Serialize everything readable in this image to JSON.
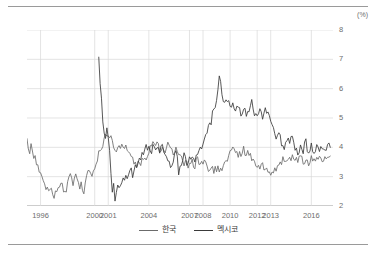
{
  "unit_label": "(%)",
  "legend": {
    "items": [
      {
        "label": "한국",
        "color": "#6b6b6b",
        "icon": "line-swatch-icon"
      },
      {
        "label": "멕시코",
        "color": "#3a3a3a",
        "icon": "line-swatch-icon"
      }
    ]
  },
  "chart_data": {
    "type": "line",
    "title": "",
    "subtitle": "",
    "xlabel": "",
    "ylabel": "(%)",
    "ylim": [
      2,
      8
    ],
    "xlim": [
      1995.0,
      2017.6
    ],
    "yticks": [
      2,
      3,
      4,
      5,
      6,
      7,
      8
    ],
    "ytick_labels": [
      "2",
      "3",
      "4",
      "5",
      "6",
      "7",
      "8"
    ],
    "xticks": [
      1996,
      2000,
      2001,
      2004,
      2007,
      2008,
      2010,
      2012,
      2013,
      2016
    ],
    "xtick_labels": [
      "1996",
      "2000",
      "2001",
      "2004",
      "2007",
      "2008",
      "2010",
      "2012",
      "2013",
      "2016"
    ],
    "grid": true,
    "grid_color": "#d8d8d8",
    "legend_position": "bottom",
    "series": [
      {
        "name": "한국",
        "color": "#6b6b6b",
        "x": [
          1995.0,
          1995.1,
          1995.2,
          1995.3,
          1995.4,
          1995.5,
          1995.6,
          1995.7,
          1995.8,
          1995.9,
          1996.0,
          1996.1,
          1996.2,
          1996.3,
          1996.4,
          1996.5,
          1996.6,
          1996.7,
          1996.8,
          1996.9,
          1997.0,
          1997.1,
          1997.2,
          1997.3,
          1997.4,
          1997.5,
          1997.6,
          1997.7,
          1997.8,
          1997.9,
          1998.0,
          1998.1,
          1998.2,
          1998.3,
          1998.4,
          1998.5,
          1998.6,
          1998.7,
          1998.8,
          1998.9,
          1999.0,
          1999.1,
          1999.2,
          1999.3,
          1999.4,
          1999.5,
          1999.6,
          1999.7,
          1999.8,
          1999.9,
          2000.0,
          2000.2,
          2000.4,
          2000.6,
          2000.8,
          2001.0,
          2001.2,
          2001.4,
          2001.6,
          2001.8,
          2002.0,
          2002.2,
          2002.4,
          2002.6,
          2002.8,
          2003.0,
          2003.2,
          2003.4,
          2003.6,
          2003.8,
          2004.0,
          2004.2,
          2004.4,
          2004.6,
          2004.8,
          2005.0,
          2005.2,
          2005.4,
          2005.6,
          2005.8,
          2006.0,
          2006.2,
          2006.4,
          2006.6,
          2006.8,
          2007.0,
          2007.2,
          2007.4,
          2007.6,
          2007.8,
          2008.0,
          2008.2,
          2008.4,
          2008.6,
          2008.8,
          2009.0,
          2009.2,
          2009.4,
          2009.6,
          2009.8,
          2010.0,
          2010.2,
          2010.4,
          2010.6,
          2010.8,
          2011.0,
          2011.2,
          2011.4,
          2011.6,
          2011.8,
          2012.0,
          2012.2,
          2012.4,
          2012.6,
          2012.8,
          2013.0,
          2013.2,
          2013.4,
          2013.6,
          2013.8,
          2014.0,
          2014.2,
          2014.4,
          2014.6,
          2014.8,
          2015.0,
          2015.2,
          2015.4,
          2015.6,
          2015.8,
          2016.0,
          2016.2,
          2016.4,
          2016.6,
          2016.8,
          2017.0,
          2017.2,
          2017.4
        ],
        "y": [
          4.2,
          4.0,
          3.9,
          4.0,
          3.8,
          3.7,
          3.6,
          3.5,
          3.4,
          3.3,
          3.2,
          3.0,
          2.9,
          2.8,
          2.7,
          2.6,
          2.6,
          2.7,
          2.6,
          2.5,
          2.4,
          2.5,
          2.6,
          2.7,
          2.6,
          2.9,
          2.8,
          2.6,
          2.5,
          2.6,
          2.7,
          2.9,
          3.1,
          3.0,
          2.8,
          2.9,
          3.1,
          2.9,
          2.7,
          2.6,
          2.8,
          2.6,
          2.5,
          2.7,
          2.9,
          3.1,
          3.3,
          3.2,
          3.0,
          3.2,
          3.4,
          3.6,
          3.9,
          4.1,
          4.3,
          4.5,
          4.3,
          4.1,
          3.9,
          4.0,
          4.2,
          4.1,
          3.9,
          3.7,
          3.6,
          3.5,
          3.4,
          3.5,
          3.6,
          3.7,
          3.9,
          4.1,
          4.0,
          4.1,
          3.9,
          4.0,
          3.9,
          4.1,
          4.0,
          3.8,
          3.9,
          3.7,
          3.6,
          3.5,
          3.4,
          3.3,
          3.5,
          3.4,
          3.6,
          3.5,
          3.4,
          3.5,
          3.3,
          3.4,
          3.2,
          3.3,
          3.2,
          3.3,
          3.5,
          3.6,
          3.8,
          3.9,
          3.8,
          3.7,
          3.8,
          3.9,
          3.8,
          3.7,
          3.6,
          3.5,
          3.4,
          3.3,
          3.4,
          3.3,
          3.2,
          3.1,
          3.2,
          3.3,
          3.4,
          3.5,
          3.6,
          3.5,
          3.6,
          3.7,
          3.6,
          3.5,
          3.6,
          3.5,
          3.6,
          3.5,
          3.6,
          3.5,
          3.6,
          3.7,
          3.6,
          3.7,
          3.8,
          3.7
        ]
      },
      {
        "name": "멕시코",
        "color": "#3a3a3a",
        "x": [
          2000.3,
          2000.4,
          2000.5,
          2000.6,
          2000.7,
          2000.8,
          2000.9,
          2001.0,
          2001.1,
          2001.2,
          2001.3,
          2001.4,
          2001.5,
          2001.6,
          2001.7,
          2001.8,
          2001.9,
          2002.0,
          2002.2,
          2002.4,
          2002.6,
          2002.8,
          2003.0,
          2003.2,
          2003.4,
          2003.6,
          2003.8,
          2004.0,
          2004.2,
          2004.4,
          2004.6,
          2004.8,
          2005.0,
          2005.2,
          2005.4,
          2005.6,
          2005.8,
          2006.0,
          2006.2,
          2006.4,
          2006.6,
          2006.8,
          2007.0,
          2007.2,
          2007.4,
          2007.6,
          2007.8,
          2008.0,
          2008.2,
          2008.4,
          2008.6,
          2008.8,
          2009.0,
          2009.2,
          2009.4,
          2009.6,
          2009.8,
          2010.0,
          2010.2,
          2010.4,
          2010.6,
          2010.8,
          2011.0,
          2011.2,
          2011.4,
          2011.6,
          2011.8,
          2012.0,
          2012.2,
          2012.4,
          2012.6,
          2012.8,
          2013.0,
          2013.2,
          2013.4,
          2013.6,
          2013.8,
          2014.0,
          2014.2,
          2014.4,
          2014.6,
          2014.8,
          2015.0,
          2015.2,
          2015.4,
          2015.6,
          2015.8,
          2016.0,
          2016.2,
          2016.4,
          2016.6,
          2016.8,
          2017.0,
          2017.2,
          2017.4
        ],
        "y": [
          7.1,
          6.3,
          5.6,
          5.0,
          4.6,
          4.4,
          4.6,
          4.4,
          4.0,
          3.2,
          2.4,
          2.9,
          2.3,
          2.5,
          2.6,
          2.7,
          2.6,
          2.8,
          2.9,
          3.0,
          3.2,
          3.1,
          3.3,
          3.5,
          3.6,
          3.8,
          4.0,
          4.1,
          3.9,
          4.1,
          4.0,
          3.9,
          4.0,
          3.8,
          3.5,
          3.3,
          3.6,
          3.9,
          3.2,
          3.5,
          3.7,
          3.4,
          3.6,
          3.8,
          3.5,
          3.7,
          3.9,
          4.2,
          4.4,
          4.6,
          4.9,
          5.3,
          5.6,
          6.4,
          5.8,
          5.5,
          5.7,
          5.3,
          5.6,
          5.2,
          5.5,
          5.1,
          5.4,
          5.0,
          5.3,
          5.6,
          5.2,
          5.0,
          5.3,
          5.1,
          5.4,
          5.2,
          5.0,
          4.7,
          4.3,
          4.6,
          4.2,
          4.0,
          4.3,
          4.1,
          4.4,
          4.0,
          3.8,
          4.1,
          3.9,
          4.2,
          3.8,
          4.0,
          3.7,
          4.0,
          3.8,
          4.1,
          3.9,
          4.1,
          4.0
        ]
      }
    ]
  }
}
